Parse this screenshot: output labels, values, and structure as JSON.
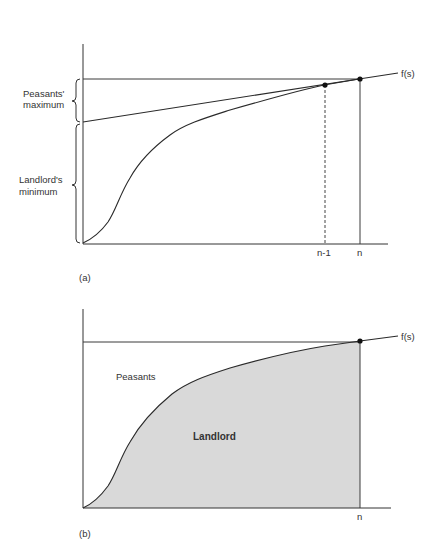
{
  "figure": {
    "panel_a": {
      "label": "(a)",
      "curve_label": "f(s)",
      "x_ticks": [
        "n-1",
        "n"
      ],
      "brace_labels": {
        "peasants_maximum": [
          "Peasants'",
          "maximum"
        ],
        "landlords_minimum": [
          "Landlord's",
          "minimum"
        ]
      }
    },
    "panel_b": {
      "label": "(b)",
      "curve_label": "f(s)",
      "x_ticks": [
        "n"
      ],
      "region_labels": {
        "upper": "Peasants",
        "lower": "Landlord"
      },
      "fill_color": "#d9d9d9"
    }
  },
  "colors": {
    "line": "#2a2a2a",
    "fill": "#d9d9d9",
    "background": "#ffffff"
  }
}
